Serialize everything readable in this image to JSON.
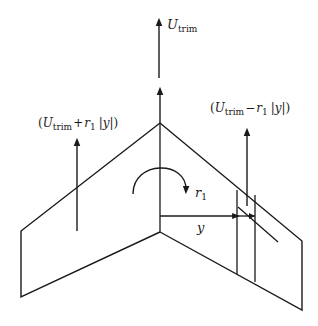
{
  "diagram": {
    "title": "",
    "colors": {
      "stroke": "#1a1a1a",
      "background": "#ffffff"
    },
    "labels": {
      "u_trim": {
        "symbol": "U",
        "subscript": "trim"
      },
      "left_velocity": {
        "open": "(",
        "symbol": "U",
        "subscript": "trim",
        "op": "+",
        "rate": "r",
        "rate_sub": "1",
        "abs_open": "|",
        "var": "y",
        "abs_close": "|",
        "close": ")"
      },
      "right_velocity": {
        "open": "(",
        "symbol": "U",
        "subscript": "trim",
        "op": "−",
        "rate": "r",
        "rate_sub": "1",
        "abs_open": "|",
        "var": "y",
        "abs_close": "|",
        "close": ")"
      },
      "yaw_rate": {
        "symbol": "r",
        "subscript": "1"
      },
      "span_distance": {
        "symbol": "y"
      }
    },
    "elements": [
      "swept-wing-outline",
      "freestream-arrow-u-trim",
      "centerline-velocity-arrow",
      "left-wing-velocity-arrow",
      "right-wing-velocity-arrow",
      "yaw-rotation-arrow",
      "spanwise-distance-arrow",
      "wing-strip-element"
    ]
  }
}
